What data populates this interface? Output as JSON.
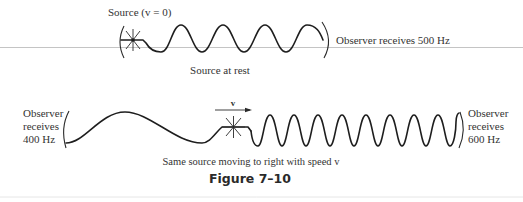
{
  "top_panel": {
    "source_label": "Source (v = 0)",
    "observer_label": "Observer receives 500 Hz",
    "caption": "Source at rest",
    "wave_cycles": 3
  },
  "bottom_panel": {
    "left_observer": {
      "line1": "Observer",
      "line2": "receives",
      "line3": "400 Hz"
    },
    "right_observer": {
      "line1": "Observer",
      "line2": "receives",
      "line3": "600 Hz"
    },
    "velocity_label": "v",
    "caption": "Same source moving to right with speed v",
    "compressed_wave_cycles": 7,
    "stretched_wave_cycles": 1
  },
  "figure_caption": "Figure 7–10",
  "colors": {
    "ink": "#1e1e1e",
    "text": "#333333",
    "rule_line": "#bdbdbd",
    "background": "#ffffff"
  }
}
